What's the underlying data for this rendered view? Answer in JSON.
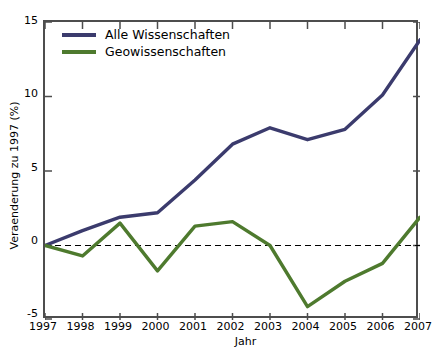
{
  "chart_data": {
    "type": "line",
    "title": "",
    "subtitle": "",
    "xlabel": "Jahr",
    "ylabel": "Veraenderung zu 1997 (%)",
    "x": [
      1997,
      1998,
      1999,
      2000,
      2001,
      2002,
      2003,
      2004,
      2005,
      2006,
      2007
    ],
    "categories": [
      "1997",
      "1998",
      "1999",
      "2000",
      "2001",
      "2002",
      "2003",
      "2004",
      "2005",
      "2006",
      "2007"
    ],
    "xlim": [
      1997,
      2007
    ],
    "ylim": [
      -5,
      15
    ],
    "xticks": [
      "1997",
      "1998",
      "1999",
      "2000",
      "2001",
      "2002",
      "2003",
      "2004",
      "2005",
      "2006",
      "2007"
    ],
    "yticks": [
      "-5",
      "0",
      "5",
      "10",
      "15"
    ],
    "ytick_values": [
      -5,
      0,
      5,
      10,
      15
    ],
    "grid": false,
    "legend_position": "upper left",
    "zero_reference_line": 0,
    "zero_reference_style": "dashed",
    "series": [
      {
        "name": "Alle Wissenschaften",
        "color": "#3b3b6d",
        "values": [
          0.0,
          1.0,
          1.9,
          2.2,
          4.4,
          6.8,
          7.9,
          7.1,
          7.8,
          10.1,
          13.8
        ]
      },
      {
        "name": "Geowissenschaften",
        "color": "#4e7a2e",
        "values": [
          0.0,
          -0.7,
          1.5,
          -1.7,
          1.3,
          1.6,
          0.0,
          -4.1,
          -2.4,
          -1.2,
          1.9
        ]
      }
    ]
  },
  "legend": {
    "entries": [
      {
        "label": "Alle Wissenschaften",
        "color": "#3b3b6d"
      },
      {
        "label": "Geowissenschaften",
        "color": "#4e7a2e"
      }
    ]
  },
  "axes": {
    "y_axis_title": "Veraenderung zu 1997 (%)",
    "x_axis_title": "Jahr",
    "y_tick_labels": [
      "15",
      "10",
      "5",
      "0",
      "-5"
    ],
    "x_tick_labels": [
      "1997",
      "1998",
      "1999",
      "2000",
      "2001",
      "2002",
      "2003",
      "2004",
      "2005",
      "2006",
      "2007"
    ]
  }
}
